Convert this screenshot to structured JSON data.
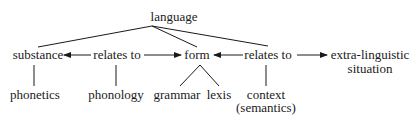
{
  "diagram": {
    "root": "language",
    "row1": {
      "substance": "substance",
      "relates_to_left": "relates to",
      "form": "form",
      "relates_to_right": "relates to",
      "extra_line1": "extra-linguistic",
      "extra_line2": "situation"
    },
    "row2": {
      "phonetics": "phonetics",
      "phonology": "phonology",
      "grammar": "grammar",
      "lexis": "lexis",
      "context_line1": "context",
      "context_line2": "(semantics)"
    }
  }
}
